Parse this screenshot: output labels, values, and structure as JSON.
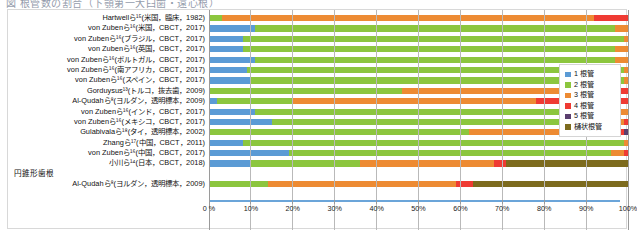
{
  "title_partial": "図  根管数の割合（下顎第一大臼歯・遠心根）",
  "chart_data": {
    "type": "bar",
    "orientation": "horizontal",
    "stacked": true,
    "normalized_percent": true,
    "title": "",
    "xlabel": "",
    "ylabel": "",
    "xlim": [
      0,
      100
    ],
    "xticks": [
      0,
      10,
      20,
      30,
      40,
      50,
      60,
      70,
      80,
      90,
      100
    ],
    "xtick_labels": [
      "0 %",
      "10%",
      "20%",
      "30%",
      "40%",
      "50%",
      "60%",
      "70%",
      "80%",
      "90%",
      "100%"
    ],
    "grid": true,
    "legend_position": "right",
    "legend": [
      "1 根管",
      "2 根管",
      "3 根管",
      "4 根管",
      "5 根管",
      "樋状根管"
    ],
    "colors": {
      "1 根管": "#5b9bd5",
      "2 根管": "#8cc63e",
      "3 根管": "#ed8b33",
      "4 根管": "#ef3b33",
      "5 根管": "#5b3f6e",
      "樋状根管": "#7d6b1e"
    },
    "categories": [
      "Hartwellら¹⁵(米国，臨床，1982)",
      "von Zubenら¹⁶(米国，CBCT，2017)",
      "von Zubenら¹⁶(ブラジル，CBCT，2017)",
      "von Zubenら¹⁶(英国，CBCT，2017)",
      "von Zubenら¹⁶(ポルトガル，CBCT，2017)",
      "von Zubenら¹⁶(南アフリカ，CBCT，2017)",
      "von Zubenら¹⁶(スペイン，CBCT，2017)",
      "Gorduysus¹³(トルコ，抜去歯，2009)",
      "Al-Qudahら⁸(ヨルダン，透明標本，2009)",
      "von Zubenら¹⁶(インド，CBCT，2017)",
      "von Zubenら¹⁶(メキシコ，CBCT，2017)",
      "Gulabivalaら¹⁸(タイ，透明標本，2002)",
      "Zhangら¹⁷(中国，CBCT，2011)",
      "von Zubenら¹⁶(中国，CBCT，2017)",
      "小川ら¹⁴(日本，CBCT，2018)",
      "Al-Qudahら⁸(ヨルダン，透明標本，2009)"
    ],
    "series": [
      {
        "name": "1 根管",
        "values": [
          0,
          11,
          8,
          8,
          11,
          9,
          10,
          0,
          2,
          11,
          15,
          0,
          8,
          19,
          10,
          0
        ]
      },
      {
        "name": "2 根管",
        "values": [
          3,
          86,
          91,
          89,
          86,
          90,
          89,
          46,
          18,
          87,
          83,
          62,
          91,
          77,
          26,
          14
        ]
      },
      {
        "name": "3 根管",
        "values": [
          89,
          3,
          1,
          3,
          3,
          1,
          1,
          42,
          58,
          2,
          1,
          32,
          1,
          3,
          32,
          45
        ]
      },
      {
        "name": "4 根管",
        "values": [
          8,
          0,
          0,
          0,
          0,
          0,
          0,
          12,
          22,
          0,
          1,
          5,
          0,
          1,
          3,
          4
        ]
      },
      {
        "name": "5 根管",
        "values": [
          0,
          0,
          0,
          0,
          0,
          0,
          0,
          0,
          0,
          0,
          0,
          1,
          0,
          0,
          0,
          0
        ]
      },
      {
        "name": "樋状根管",
        "values": [
          0,
          0,
          0,
          0,
          0,
          0,
          0,
          0,
          0,
          0,
          0,
          0,
          0,
          0,
          29,
          37
        ]
      }
    ],
    "group_labels": [
      {
        "label": "円錐形歯根",
        "before_category_index": 15
      }
    ]
  }
}
